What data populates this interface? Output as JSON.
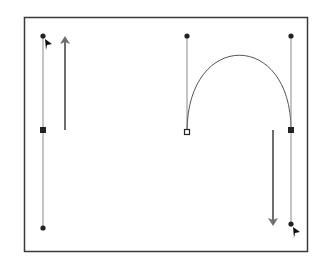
{
  "diagram": {
    "colors": {
      "frame": "#3a3a3a",
      "handle_line": "#8a8a8a",
      "arrow": "#6e6e6e",
      "curve": "#555555",
      "point": "#222222"
    },
    "left_panel": {
      "description": "Handle line with anchor point, handle dragged upward",
      "arrow_direction": "up"
    },
    "right_panel": {
      "description": "Arc curve with start point (open) and end point (filled), end handle dragged downward",
      "arrow_direction": "down"
    }
  }
}
